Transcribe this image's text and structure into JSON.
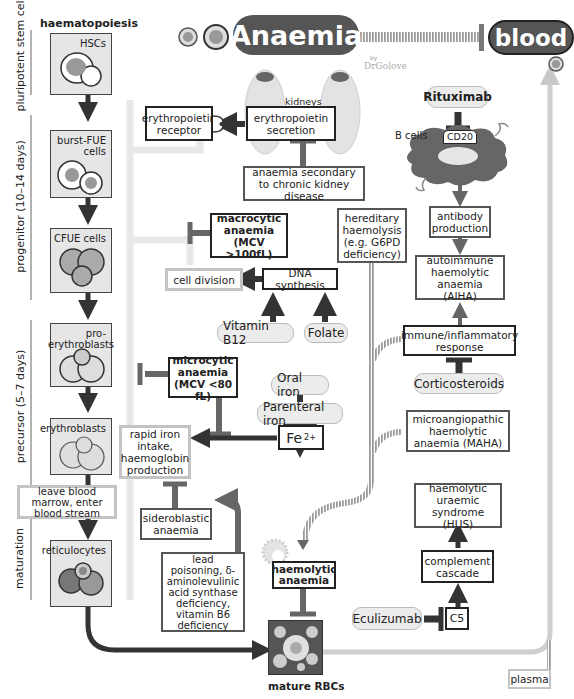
{
  "header": {
    "title": "Anaemia",
    "subtitle": "blood",
    "byline_by": "by",
    "byline_author": "DrGolove"
  },
  "haematopoiesis": {
    "heading": "haematopoiesis",
    "stages": [
      {
        "label": "pluripotent stem cell"
      },
      {
        "label": "progenitor (10–14 days)"
      },
      {
        "label": "precursor (5–7 days)"
      },
      {
        "label": "maturation"
      }
    ],
    "cells": [
      {
        "label": "HSCs"
      },
      {
        "label": "burst-FUE cells"
      },
      {
        "label": "CFUE cells"
      },
      {
        "label": "pro-erythroblasts"
      },
      {
        "label": "erythroblasts"
      },
      {
        "label": "reticulocytes"
      }
    ],
    "transition_label": "leave blood marrow, enter blood stream",
    "mature_label": "mature RBCs"
  },
  "kidney": {
    "organ_label": "kidneys",
    "secretion": "erythropoietin secretion",
    "receptor": "erythropoietin receptor",
    "ckd": "anaemia secondary to chronic kidney disease"
  },
  "macrocytic": {
    "title": "macrocytic anaemia",
    "mcv": "(MCV >100fL)",
    "cell_division": "cell division",
    "dna_synthesis": "DNA synthesis",
    "vitamin_b12": "Vitamin B12",
    "folate": "Folate"
  },
  "microcytic": {
    "title": "microcytic anaemia",
    "mcv": "(MCV <80 fL)",
    "oral_iron": "Oral iron",
    "parenteral_iron": "Parenteral iron",
    "fe": "Fe",
    "fe_charge": "2+",
    "iron_intake": "rapid iron intake, haemoglobin production",
    "sideroblastic": "sideroblastic anaemia",
    "causes": "lead poisoning, δ-aminolevulinic acid synthase deficiency, vitamin B6 deficiency"
  },
  "haemolytic": {
    "title": "haemolytic anaemia",
    "hereditary": "hereditary haemolysis (e.g. G6PD deficiency)",
    "rituximab": "Rituximab",
    "cd20": "CD20",
    "b_cells": "B cells",
    "antibody": "antibody production",
    "aiha": "autoimmune haemolytic anaemia (AIHA)",
    "immune": "immune/inflammatory response",
    "corticosteroids": "Corticosteroids",
    "maha": "microangiopathic haemolytic anaemia (MAHA)",
    "hus": "haemolytic uraemic syndrome (HUS)",
    "complement": "complement cascade",
    "eculizumab": "Eculizumab",
    "c5": "C5",
    "plasma": "plasma"
  },
  "colors": {
    "dark": "#333333",
    "mid": "#666666",
    "light_track": "#cfcfcf",
    "title_bg": "#555555",
    "pill_bg": "#ececec"
  }
}
